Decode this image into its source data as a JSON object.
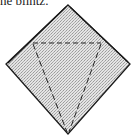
{
  "caption": {
    "text": "he blintz."
  },
  "diagram": {
    "type": "origami-fold-step",
    "shape": "diamond (square rotated 45°)",
    "fill": "stippled gray",
    "colors": {
      "outline": "#1a1a1a",
      "fill": "#d6d6d6",
      "dash": "#222222"
    },
    "fold_lines": [
      {
        "style": "dashed",
        "from": "upper-left edge",
        "to": "upper-right edge",
        "orientation": "horizontal"
      },
      {
        "style": "dashed",
        "from": "upper-left of horizontal line",
        "to": "bottom corner"
      },
      {
        "style": "dashed",
        "from": "upper-right of horizontal line",
        "to": "bottom corner"
      }
    ]
  }
}
